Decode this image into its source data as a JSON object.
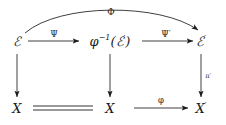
{
  "diagram": {
    "type": "commutative-diagram",
    "background_color": "#ffffff",
    "ink_color": "#1c1c1c",
    "objects": {
      "top_left": "ℰ",
      "top_middle_prefix": "φ",
      "top_middle_exponent": "−1",
      "top_middle_open": "(",
      "top_middle_inner": "ℰ",
      "top_middle_inner_prime": "′",
      "top_middle_close": ")",
      "top_right": "ℰ",
      "top_right_prime": "′",
      "bottom_left": "X",
      "bottom_middle": "X",
      "bottom_right": "X",
      "bottom_right_prime": "′"
    },
    "arrows": {
      "curved_top": {
        "label": "Φ",
        "from": "top_left",
        "to": "top_right",
        "style": "curved",
        "direction": "right"
      },
      "top_first": {
        "label": "Ψ",
        "from": "top_left",
        "to": "top_middle",
        "style": "straight",
        "direction": "right"
      },
      "top_second": {
        "label": "Ψ′",
        "from": "top_middle",
        "to": "top_right",
        "style": "straight",
        "direction": "right"
      },
      "vertical_left": {
        "label": "",
        "from": "top_left",
        "to": "bottom_left",
        "style": "straight",
        "direction": "down"
      },
      "vertical_middle": {
        "label": "",
        "from": "top_middle",
        "to": "bottom_middle",
        "style": "straight",
        "direction": "down"
      },
      "vertical_right": {
        "label": "π′",
        "from": "top_right",
        "to": "bottom_right",
        "style": "straight",
        "direction": "down"
      },
      "bottom_equality": {
        "label": "",
        "from": "bottom_left",
        "to": "bottom_middle",
        "style": "double-line-equality",
        "direction": "none"
      },
      "bottom_map": {
        "label": "φ",
        "from": "bottom_middle",
        "to": "bottom_right",
        "style": "straight",
        "direction": "right"
      }
    }
  }
}
